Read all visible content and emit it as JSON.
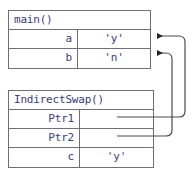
{
  "diagram": {
    "text_color": "#3b3b7a",
    "border_color": "#6f6f78",
    "pointer_color": "#4a4a52",
    "background": "#ffffff"
  },
  "frames": [
    {
      "id": "main",
      "title": "main()",
      "rows": [
        {
          "name": "a",
          "value": "'y'"
        },
        {
          "name": "b",
          "value": "'n'"
        }
      ]
    },
    {
      "id": "indirect_swap",
      "title": "IndirectSwap()",
      "rows": [
        {
          "name": "Ptr1",
          "value": ""
        },
        {
          "name": "Ptr2",
          "value": ""
        },
        {
          "name": "c",
          "value": "'y'"
        }
      ]
    }
  ],
  "pointers": [
    {
      "id": "ptr1-to-a",
      "from": "Ptr1",
      "to": "a",
      "label": ""
    },
    {
      "id": "ptr2-to-b",
      "from": "Ptr2",
      "to": "b",
      "label": ""
    }
  ]
}
